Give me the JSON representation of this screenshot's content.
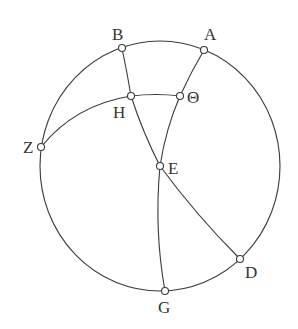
{
  "diagram": {
    "type": "spherical-geometry-figure",
    "colors": {
      "stroke": "#3a3a3a",
      "label": "#333333",
      "background": "#ffffff"
    },
    "outer_circle": {
      "cx": 160,
      "cy": 166,
      "rx": 120,
      "ry": 125
    },
    "points": {
      "A": {
        "label": "A",
        "x": 204,
        "y": 50
      },
      "B": {
        "label": "B",
        "x": 122,
        "y": 48
      },
      "H": {
        "label": "H",
        "x": 131,
        "y": 96
      },
      "Theta": {
        "label": "Θ",
        "x": 180,
        "y": 96
      },
      "Z": {
        "label": "Z",
        "x": 41,
        "y": 147
      },
      "E": {
        "label": "E",
        "x": 160,
        "y": 166
      },
      "D": {
        "label": "D",
        "x": 240,
        "y": 259
      },
      "G": {
        "label": "G",
        "x": 165,
        "y": 291
      }
    },
    "arcs": [
      "B-H-E-D",
      "A-Θ-E-G",
      "Z-H-Θ",
      "outer circle through B, A, D, G, Z"
    ]
  }
}
